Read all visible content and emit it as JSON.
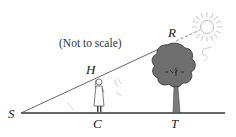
{
  "diagram": {
    "note": "(Not to scale)",
    "points": {
      "S": "S",
      "H": "H",
      "R": "R",
      "C": "C",
      "T": "T"
    },
    "annotations": {
      "pencil_mark_1": "5",
      "pencil_mark_2": "4ft"
    },
    "colors": {
      "line": "#333333",
      "tree": "#6e6e6e",
      "sun": "#bdbdbd"
    }
  }
}
